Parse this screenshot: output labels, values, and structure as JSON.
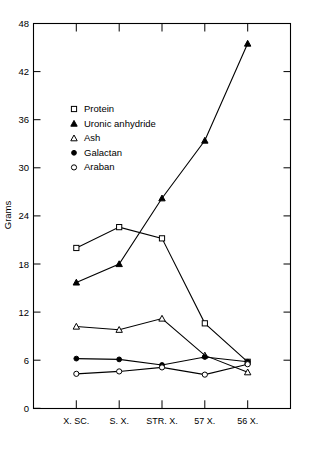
{
  "chart_data": {
    "type": "line",
    "title": "",
    "xlabel": "",
    "ylabel": "Grams",
    "categories": [
      "X. SC.",
      "S. X.",
      "STR. X.",
      "57 X.",
      "56 X."
    ],
    "ylim": [
      0,
      48
    ],
    "yticks": [
      0,
      6,
      12,
      18,
      24,
      30,
      36,
      42,
      48
    ],
    "grid": false,
    "legend_position": "upper-left-inside",
    "series": [
      {
        "name": "Protein",
        "marker": "open-square",
        "values": [
          20.0,
          22.6,
          21.2,
          10.6,
          5.8
        ]
      },
      {
        "name": "Uronic anhydride",
        "marker": "filled-triangle",
        "values": [
          15.7,
          18.0,
          26.2,
          33.4,
          45.5
        ]
      },
      {
        "name": "Ash",
        "marker": "open-triangle",
        "values": [
          10.2,
          9.8,
          11.2,
          6.6,
          4.5
        ]
      },
      {
        "name": "Galactan",
        "marker": "filled-circle",
        "values": [
          6.2,
          6.1,
          5.4,
          6.4,
          5.8
        ]
      },
      {
        "name": "Araban",
        "marker": "open-circle",
        "values": [
          4.3,
          4.6,
          5.1,
          4.2,
          5.5
        ]
      }
    ],
    "colors": {
      "line": "#000000",
      "marker_fill": "#000000",
      "marker_open": "#ffffff",
      "axis": "#000000",
      "background": "#ffffff"
    }
  },
  "axis": {
    "y_tick_labels": [
      "48",
      "42",
      "36",
      "30",
      "24",
      "18",
      "12",
      "6",
      "0"
    ],
    "y_title": "Grams",
    "x_tick_labels": [
      "X. SC.",
      "S. X.",
      "STR. X.",
      "57 X.",
      "56 X."
    ]
  },
  "legend": {
    "entries": [
      {
        "label": "Protein",
        "marker": "open-square"
      },
      {
        "label": "Uronic anhydride",
        "marker": "filled-triangle"
      },
      {
        "label": "Ash",
        "marker": "open-triangle"
      },
      {
        "label": "Galactan",
        "marker": "filled-circle"
      },
      {
        "label": "Araban",
        "marker": "open-circle"
      }
    ]
  }
}
